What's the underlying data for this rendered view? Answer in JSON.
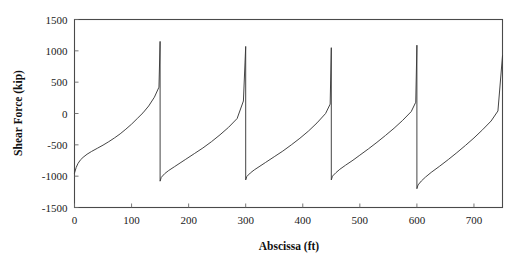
{
  "chart_data": {
    "type": "line",
    "title": "",
    "subtitle": "",
    "xlabel": "Abscissa (ft)",
    "ylabel": "Shear Force (kip)",
    "xlim": [
      0,
      750
    ],
    "ylim": [
      -1500,
      1500
    ],
    "xticks": [
      0,
      100,
      200,
      300,
      400,
      500,
      600,
      700
    ],
    "yticks": [
      1500,
      1000,
      500,
      0,
      -500,
      -1000,
      -1500
    ],
    "xtick_labels": [
      "0",
      "100",
      "200",
      "300",
      "400",
      "500",
      "600",
      "700"
    ],
    "ytick_labels": [
      "1500",
      "1000",
      "500",
      "0",
      "-500",
      "-1000",
      "-1500"
    ],
    "grid": false,
    "legend": null,
    "legend_position": "none",
    "series": [
      {
        "name": "Shear Force",
        "color": "#3a3a3a",
        "x": [
          0,
          3,
          6,
          10,
          15,
          22,
          30,
          40,
          50,
          60,
          70,
          80,
          90,
          100,
          110,
          120,
          130,
          140,
          148,
          150,
          150,
          152,
          158,
          165,
          175,
          185,
          195,
          210,
          225,
          240,
          255,
          270,
          285,
          296,
          300,
          300,
          302,
          308,
          315,
          325,
          335,
          350,
          365,
          380,
          395,
          410,
          425,
          440,
          448,
          450,
          450,
          452,
          458,
          465,
          475,
          488,
          500,
          515,
          530,
          545,
          560,
          575,
          590,
          598,
          600,
          600,
          602,
          608,
          615,
          625,
          640,
          655,
          670,
          685,
          700,
          715,
          730,
          742,
          750
        ],
        "y": [
          -950,
          -860,
          -800,
          -745,
          -700,
          -650,
          -605,
          -555,
          -505,
          -450,
          -390,
          -325,
          -250,
          -170,
          -80,
          10,
          120,
          260,
          420,
          1150,
          -1080,
          -1020,
          -960,
          -910,
          -850,
          -790,
          -730,
          -640,
          -550,
          -450,
          -340,
          -220,
          -80,
          200,
          1070,
          -1060,
          -1005,
          -950,
          -900,
          -840,
          -780,
          -690,
          -600,
          -500,
          -395,
          -280,
          -150,
          0,
          150,
          1050,
          -1060,
          -1000,
          -945,
          -890,
          -825,
          -745,
          -665,
          -565,
          -460,
          -350,
          -235,
          -110,
          30,
          180,
          1090,
          -1200,
          -1140,
          -1075,
          -1015,
          -940,
          -840,
          -735,
          -625,
          -510,
          -390,
          -260,
          -120,
          40,
          920
        ]
      }
    ],
    "features": {
      "pattern": "sawtooth",
      "cycles": 5,
      "cycle_length_ft": 150,
      "drop_locations_ft": [
        150,
        300,
        450,
        600
      ],
      "peak_values_kip": [
        1150,
        1070,
        1050,
        1090,
        920
      ],
      "trough_values_kip": [
        -950,
        -1080,
        -1060,
        -1060,
        -1200
      ]
    }
  },
  "axes": {
    "x_title": "Abscissa (ft)",
    "y_title": "Shear Force (kip)"
  }
}
